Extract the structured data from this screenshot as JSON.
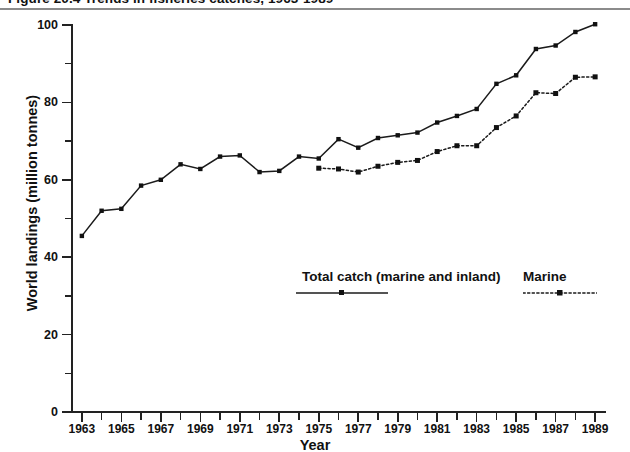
{
  "figure": {
    "title": "Figure 20.4   Trends in fisheries catches, 1963-1989",
    "axis_x_title": "Year",
    "axis_y_title": "World landings (million tonnes)"
  },
  "legend": {
    "total_label": "Total catch (marine and inland)",
    "marine_label": "Marine",
    "total_style": "solid line with square marker",
    "marine_style": "dotted line with square marker"
  },
  "colors": {
    "ink": "#1b1b1b",
    "background": "#ffffff"
  },
  "chart_data": {
    "type": "line",
    "title": "Figure 20.4   Trends in fisheries catches, 1963-1989",
    "xlabel": "Year",
    "ylabel": "World landings (million tonnes)",
    "xlim": [
      1962.5,
      1989.5
    ],
    "ylim": [
      0,
      100
    ],
    "grid": false,
    "legend_position": "inside lower-right",
    "y_ticks_major": [
      0,
      20,
      40,
      60,
      80,
      100
    ],
    "y_ticks_major_labels": [
      "0",
      "20",
      "40",
      "60",
      "80",
      "100"
    ],
    "y_ticks_minor": [
      10,
      30,
      50,
      70,
      90
    ],
    "x_ticks": [
      1963,
      1964,
      1965,
      1966,
      1967,
      1968,
      1969,
      1970,
      1971,
      1972,
      1973,
      1974,
      1975,
      1976,
      1977,
      1978,
      1979,
      1980,
      1981,
      1982,
      1983,
      1984,
      1985,
      1986,
      1987,
      1988,
      1989
    ],
    "x_tick_labels_shown": [
      "1963",
      "1965",
      "1967",
      "1969",
      "1971",
      "1973",
      "1975",
      "1977",
      "1979",
      "1981",
      "1983",
      "1985",
      "1987",
      "1989"
    ],
    "series": [
      {
        "name": "Total catch (marine and inland)",
        "style": "solid",
        "marker": "square",
        "x": [
          1963,
          1964,
          1965,
          1966,
          1967,
          1968,
          1969,
          1970,
          1971,
          1972,
          1973,
          1974,
          1975,
          1976,
          1977,
          1978,
          1979,
          1980,
          1981,
          1982,
          1983,
          1984,
          1985,
          1986,
          1987,
          1988,
          1989
        ],
        "values": [
          45.5,
          52.0,
          52.5,
          58.5,
          60.0,
          64.0,
          62.8,
          66.0,
          66.3,
          62.0,
          62.3,
          66.0,
          65.5,
          70.5,
          68.3,
          70.8,
          71.5,
          72.2,
          74.8,
          76.5,
          78.3,
          84.8,
          87.0,
          93.8,
          94.7,
          98.2,
          100.2
        ]
      },
      {
        "name": "Marine",
        "style": "dotted",
        "marker": "square",
        "x": [
          1975,
          1976,
          1977,
          1978,
          1979,
          1980,
          1981,
          1982,
          1983,
          1984,
          1985,
          1986,
          1987,
          1988,
          1989
        ],
        "values": [
          63.0,
          62.8,
          62.0,
          63.5,
          64.5,
          65.0,
          67.3,
          68.8,
          68.8,
          73.5,
          76.5,
          82.5,
          82.3,
          86.5,
          86.6
        ]
      }
    ]
  }
}
